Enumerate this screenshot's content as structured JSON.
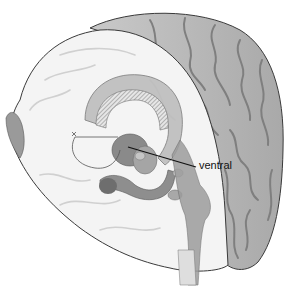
{
  "figure": {
    "labels": [
      {
        "id": "ventral",
        "text": "ventral",
        "x": 199,
        "y": 163
      }
    ],
    "leader_line": {
      "from": [
        128,
        147
      ],
      "to": [
        196,
        167
      ]
    },
    "colors": {
      "background": "#ffffff",
      "cortex_light": "#f2f2f2",
      "cortex_dark": "#bdbdbd",
      "gyri_shadow": "#8c8c8c",
      "structure_mid": "#9e9e9e",
      "structure_dark": "#6e6e6e",
      "outline": "#3a3a3a",
      "leader": "#111111"
    }
  }
}
